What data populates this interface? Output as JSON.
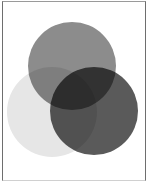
{
  "diagram": {
    "type": "venn",
    "sets": [
      {
        "name": "top-circle",
        "color": "#8c8c8c",
        "cx": 72,
        "cy": 66,
        "r": 44
      },
      {
        "name": "left-circle",
        "color": "#e6e6e6",
        "cx": 52,
        "cy": 112,
        "r": 45
      },
      {
        "name": "right-circle",
        "color": "#5a5a5a",
        "cx": 94,
        "cy": 111,
        "r": 44
      }
    ],
    "labels": []
  }
}
